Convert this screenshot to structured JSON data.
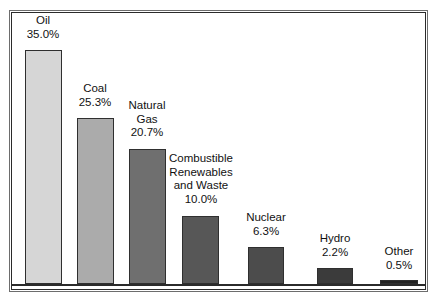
{
  "chart_data": {
    "type": "bar",
    "title": "",
    "subtitle": "",
    "xlabel": "",
    "ylabel": "",
    "grid": false,
    "legend": "none",
    "axis": {
      "baseline_shown": true,
      "y_axis_shown": false,
      "ticks_shown": false
    },
    "ylim": [
      0,
      38
    ],
    "unit": "%",
    "categories": [
      "Oil",
      "Coal",
      "Natural Gas",
      "Combustible Renewables and Waste",
      "Nuclear",
      "Hydro",
      "Other"
    ],
    "values": [
      35.0,
      25.3,
      20.7,
      10.0,
      6.3,
      2.2,
      0.5
    ],
    "value_labels": [
      "35.0%",
      "25.3%",
      "20.7%",
      "10.0%",
      "6.3%",
      "2.2%",
      "0.5%"
    ],
    "bars": [
      {
        "name": "Oil",
        "name_lines": [
          "Oil"
        ],
        "value": 35.0,
        "value_label": "35.0%",
        "color": "#d6d6d6",
        "border_color": "#2f2f2f",
        "x": 25,
        "width": 37,
        "top": 50,
        "label_x": 8,
        "label_y": 14,
        "label_width": 70
      },
      {
        "name": "Coal",
        "name_lines": [
          "Coal"
        ],
        "value": 25.3,
        "value_label": "25.3%",
        "color": "#ababab",
        "border_color": "#2f2f2f",
        "x": 77,
        "width": 37,
        "top": 118,
        "label_x": 60,
        "label_y": 82,
        "label_width": 70
      },
      {
        "name": "Natural Gas",
        "name_lines": [
          "Natural",
          "Gas"
        ],
        "value": 20.7,
        "value_label": "20.7%",
        "color": "#6f6f6f",
        "border_color": "#2f2f2f",
        "x": 129,
        "width": 37,
        "top": 149,
        "label_x": 112,
        "label_y": 99,
        "label_width": 70
      },
      {
        "name": "Combustible Renewables and Waste",
        "name_lines": [
          "Combustible",
          "Renewables",
          "and Waste"
        ],
        "value": 10.0,
        "value_label": "10.0%",
        "color": "#575757",
        "border_color": "#2f2f2f",
        "x": 182,
        "width": 37,
        "top": 216,
        "label_x": 162,
        "label_y": 152,
        "label_width": 78
      },
      {
        "name": "Nuclear",
        "name_lines": [
          "Nuclear"
        ],
        "value": 6.3,
        "value_label": "6.3%",
        "color": "#4c4c4c",
        "border_color": "#2f2f2f",
        "x": 248,
        "width": 36,
        "top": 247,
        "label_x": 231,
        "label_y": 211,
        "label_width": 70
      },
      {
        "name": "Hydro",
        "name_lines": [
          "Hydro"
        ],
        "value": 2.2,
        "value_label": "2.2%",
        "color": "#3b3b3b",
        "border_color": "#2f2f2f",
        "x": 317,
        "width": 36,
        "top": 268,
        "label_x": 300,
        "label_y": 232,
        "label_width": 70
      },
      {
        "name": "Other",
        "name_lines": [
          "Other"
        ],
        "value": 0.5,
        "value_label": "0.5%",
        "color": "#232323",
        "border_color": "#2f2f2f",
        "x": 380,
        "width": 38,
        "top": 280,
        "label_x": 364,
        "label_y": 245,
        "label_width": 70
      }
    ]
  }
}
